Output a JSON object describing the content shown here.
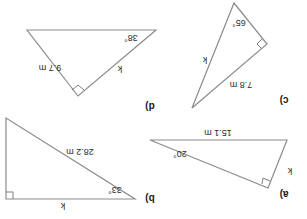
{
  "figure": {
    "orientation": "rotated 180 degrees",
    "line_color": "#8c8c8c",
    "text_color": "#2a2a2a"
  },
  "triangles": {
    "a": {
      "part_label": "a)",
      "side_label": "15.1 m",
      "angle_label": "20°",
      "unknown_label": "k"
    },
    "b": {
      "part_label": "b)",
      "side_label": "28.2 m",
      "angle_label": "33°",
      "unknown_label": "k"
    },
    "c": {
      "part_label": "c)",
      "side_label": "7.8 m",
      "angle_label": "65°",
      "unknown_label": "k"
    },
    "d": {
      "part_label": "d)",
      "side_label": "9.7 m",
      "angle_label": "38°",
      "unknown_label": "k"
    }
  }
}
